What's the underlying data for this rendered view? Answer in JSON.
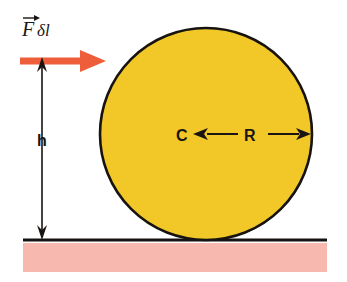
{
  "figure": {
    "kind": "physics-diagram",
    "width": 347,
    "height": 282,
    "background_color": "#ffffff"
  },
  "colors": {
    "disc_fill": "#F2C829",
    "disc_outline": "#171310",
    "ground_band": "#F6B8AF",
    "ground_line": "#17120F",
    "force_arrow": "#EE5E3A",
    "dimension_arrow": "#1A1512",
    "text": "#1A1512"
  },
  "labels": {
    "force": {
      "symbol": "F",
      "vector_accent": "arrow-over",
      "suffix": "δl",
      "full_text": "Fδl",
      "x": 22,
      "y": 33
    },
    "height": {
      "text": "h",
      "x": 42,
      "y": 146
    },
    "center": {
      "text": "C",
      "x": 183,
      "y": 141
    },
    "radius": {
      "text": "R",
      "x": 250,
      "y": 141
    }
  },
  "disc": {
    "center_x": 206,
    "center_y": 134,
    "radius": 106,
    "outline_width": 2.6
  },
  "ground": {
    "line_y": 240,
    "line_x_start": 23,
    "line_x_end": 327,
    "line_width": 3,
    "band_top": 243,
    "band_height": 29,
    "band_x_start": 23,
    "band_width": 304
  },
  "force_arrow": {
    "y": 61,
    "x_start": 20,
    "x_tip": 106,
    "shaft_thickness": 7,
    "head_length": 26,
    "head_half_height": 11
  },
  "height_arrow": {
    "x": 42,
    "y_top": 57,
    "y_bottom": 240,
    "shaft_width": 1.6,
    "head_length": 15,
    "head_half_width": 5
  },
  "radius_arrow": {
    "y": 134,
    "left_head_x": 193,
    "left_shaft_end": 238,
    "right_shaft_start": 268,
    "right_head_x": 311,
    "shaft_width": 2,
    "head_length": 15,
    "head_half_width": 6
  }
}
